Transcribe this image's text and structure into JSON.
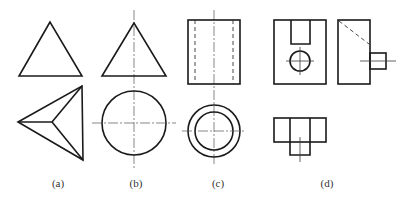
{
  "figure": {
    "panels": [
      {
        "id": "a",
        "label": "(a)",
        "letter": "a",
        "subject": "triangular pyramid",
        "views": [
          "front-view triangle",
          "top-view triangle with three edges to apex"
        ]
      },
      {
        "id": "b",
        "label": "(b)",
        "letter": "b",
        "subject": "cone",
        "views": [
          "front-view triangle",
          "top-view circle"
        ]
      },
      {
        "id": "c",
        "label": "(c)",
        "letter": "c",
        "subject": "hollow cylinder",
        "views": [
          "front-view rectangle with hidden bore lines",
          "top-view concentric circles"
        ]
      },
      {
        "id": "d",
        "label": "(d)",
        "letter": "d",
        "subject": "block with slot, hole and cylindrical boss",
        "views": [
          "front view",
          "side view",
          "top view"
        ]
      }
    ],
    "colors": {
      "line": "#1a1a1a",
      "background": "#ffffff",
      "label": "#333333"
    }
  }
}
